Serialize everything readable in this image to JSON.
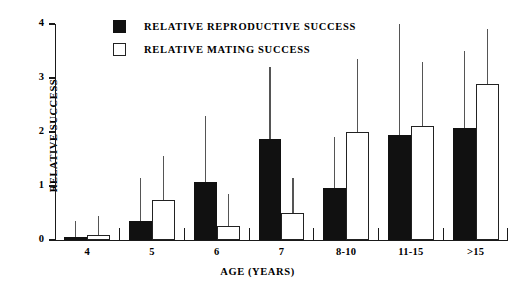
{
  "chart_data": {
    "type": "bar",
    "title": "",
    "xlabel": "AGE (YEARS)",
    "ylabel": "RELATIVE SUCCESS",
    "categories": [
      "4",
      "5",
      "6",
      "7",
      "8-10",
      "11-15",
      ">15"
    ],
    "ylim": [
      0,
      4
    ],
    "yticks": [
      0,
      1,
      2,
      3,
      4
    ],
    "ytick_labels": [
      "0",
      "1",
      "2",
      "3",
      "4"
    ],
    "grid": false,
    "legend_position": "top-left-inside",
    "series": [
      {
        "name": "RELATIVE REPRODUCTIVE SUCCESS",
        "color": "#111111",
        "fill": "solid-black",
        "values": [
          0.05,
          0.35,
          1.08,
          1.87,
          0.97,
          1.95,
          2.07
        ],
        "error_upper": [
          0.35,
          1.15,
          2.3,
          3.2,
          1.9,
          4.0,
          3.5
        ]
      },
      {
        "name": "RELATIVE MATING SUCCESS",
        "color": "#ffffff",
        "fill": "open-white",
        "values": [
          0.1,
          0.75,
          0.26,
          0.5,
          2.0,
          2.12,
          2.88
        ],
        "error_upper": [
          0.45,
          1.55,
          0.85,
          1.15,
          3.35,
          3.3,
          3.9
        ]
      }
    ]
  },
  "legend": {
    "items": [
      {
        "label": "RELATIVE REPRODUCTIVE SUCCESS",
        "swatch": "filled-black-square"
      },
      {
        "label": "RELATIVE MATING SUCCESS",
        "swatch": "open-white-square"
      }
    ]
  },
  "axes": {
    "y_title": "RELATIVE SUCCESS",
    "x_title": "AGE (YEARS)"
  }
}
